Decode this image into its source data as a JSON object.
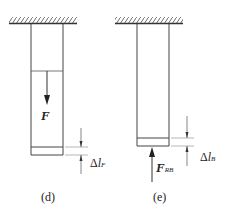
{
  "diagram": {
    "panels": [
      {
        "id": "d",
        "caption": "(d)",
        "force_label": "F",
        "force_subscript": "",
        "force_direction": "down",
        "delta_symbol": "Δ",
        "delta_var": "l",
        "delta_subscript": "F"
      },
      {
        "id": "e",
        "caption": "(e)",
        "force_label": "F",
        "force_subscript": "RB",
        "force_direction": "up",
        "delta_symbol": "Δ",
        "delta_var": "l",
        "delta_subscript": "B"
      }
    ],
    "colors": {
      "line": "#333333",
      "hatch": "#444444"
    }
  }
}
